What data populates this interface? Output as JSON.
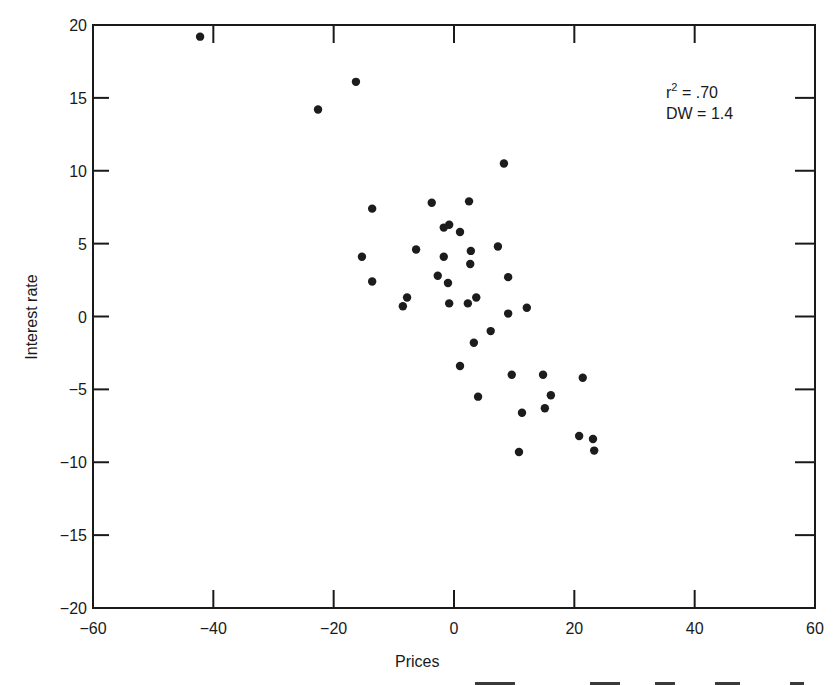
{
  "chart_data": {
    "type": "scatter",
    "title": "",
    "xlabel": "Prices",
    "ylabel": "Interest rate",
    "xlim": [
      -60,
      60
    ],
    "ylim": [
      -20,
      20
    ],
    "x_ticks": [
      -60,
      -40,
      -20,
      0,
      20,
      40,
      60
    ],
    "y_ticks": [
      -20,
      -15,
      -10,
      -5,
      0,
      5,
      10,
      15,
      20
    ],
    "x_tick_labels": [
      "−60",
      "−40",
      "−20",
      "0",
      "20",
      "40",
      "60"
    ],
    "y_tick_labels": [
      "−20",
      "−15",
      "−10",
      "−5",
      "0",
      "5",
      "10",
      "15",
      "20"
    ],
    "grid": false,
    "legend": null,
    "annotations": [
      {
        "text": "r² = .70",
        "base": "r",
        "sup": "2",
        "rest": " = .70"
      },
      {
        "text": "DW = 1.4"
      }
    ],
    "series": [
      {
        "name": "observations",
        "marker": "filled-circle",
        "color": "#1c1c1c",
        "points": [
          [
            -42.2,
            19.2
          ],
          [
            -22.6,
            14.2
          ],
          [
            -16.3,
            16.1
          ],
          [
            8.3,
            10.5
          ],
          [
            -13.6,
            7.4
          ],
          [
            -3.7,
            7.8
          ],
          [
            2.5,
            7.9
          ],
          [
            -1.7,
            6.1
          ],
          [
            -0.8,
            6.3
          ],
          [
            1.0,
            5.8
          ],
          [
            7.3,
            4.8
          ],
          [
            -6.3,
            4.6
          ],
          [
            -15.3,
            4.1
          ],
          [
            2.8,
            4.5
          ],
          [
            -1.7,
            4.1
          ],
          [
            2.7,
            3.6
          ],
          [
            -13.6,
            2.4
          ],
          [
            -2.7,
            2.8
          ],
          [
            -1.0,
            2.3
          ],
          [
            9.0,
            2.7
          ],
          [
            -7.8,
            1.3
          ],
          [
            -8.5,
            0.7
          ],
          [
            -0.8,
            0.9
          ],
          [
            2.3,
            0.9
          ],
          [
            3.7,
            1.3
          ],
          [
            9.0,
            0.2
          ],
          [
            12.1,
            0.6
          ],
          [
            6.1,
            -1.0
          ],
          [
            3.3,
            -1.8
          ],
          [
            1.0,
            -3.4
          ],
          [
            9.6,
            -4.0
          ],
          [
            14.8,
            -4.0
          ],
          [
            21.4,
            -4.2
          ],
          [
            4.0,
            -5.5
          ],
          [
            16.1,
            -5.4
          ],
          [
            11.3,
            -6.6
          ],
          [
            15.1,
            -6.3
          ],
          [
            20.8,
            -8.2
          ],
          [
            23.1,
            -8.4
          ],
          [
            23.3,
            -9.2
          ],
          [
            10.8,
            -9.3
          ]
        ]
      }
    ]
  },
  "plot": {
    "xlabel": "Prices",
    "ylabel": "Interest rate",
    "annotation_r2_base": "r",
    "annotation_r2_sup": "2",
    "annotation_r2_rest": " = .70",
    "annotation_dw": "DW = 1.4"
  }
}
